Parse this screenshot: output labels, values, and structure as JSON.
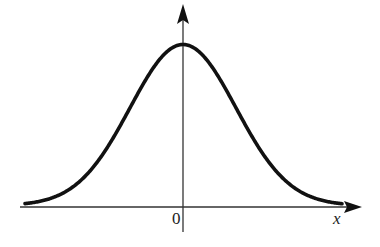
{
  "figure": {
    "type": "normal distribution bell curve",
    "origin_label": "0",
    "x_axis_label": "x",
    "colors": {
      "curve": "#111111",
      "axes": "#333333",
      "background": "#ffffff"
    }
  },
  "chart_data": {
    "type": "line",
    "title": "",
    "xlabel": "x",
    "ylabel": "",
    "tick_labels": [
      "0"
    ],
    "series": [
      {
        "name": "bell curve",
        "function": "gaussian",
        "mean": 0,
        "peak_at_x": 0
      }
    ],
    "grid": false,
    "legend": null
  }
}
